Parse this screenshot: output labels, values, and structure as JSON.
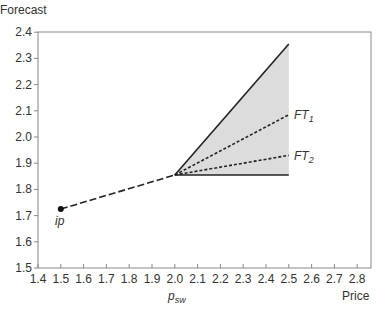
{
  "chart_data": {
    "type": "line",
    "title": "",
    "xlabel": "Price",
    "ylabel": "Forecast",
    "xlim": [
      1.4,
      2.85
    ],
    "ylim": [
      1.5,
      2.4
    ],
    "x_ticks": [
      "1.4",
      "1.5",
      "1.6",
      "1.7",
      "1.8",
      "1.9",
      "2.0",
      "2.1",
      "2.2",
      "2.3",
      "2.4",
      "2.5",
      "2.6",
      "2.7",
      "2.8"
    ],
    "y_ticks": [
      "1.5",
      "1.6",
      "1.7",
      "1.8",
      "1.9",
      "2.0",
      "2.1",
      "2.2",
      "2.3",
      "2.4"
    ],
    "grid": false,
    "legend": "none",
    "x_annotation": {
      "text": "p",
      "subscript": "sw",
      "x": 2.0
    },
    "shaded_region": {
      "polygon": [
        [
          2.0,
          1.855
        ],
        [
          2.5,
          2.355
        ],
        [
          2.5,
          1.855
        ]
      ],
      "color": "#dcdcdc"
    },
    "series": [
      {
        "name": "path from ip",
        "style": "long-dash",
        "x": [
          1.5,
          2.0
        ],
        "y": [
          1.725,
          1.855
        ]
      },
      {
        "name": "upper bound",
        "style": "solid",
        "x": [
          2.0,
          2.5
        ],
        "y": [
          1.855,
          2.355
        ]
      },
      {
        "name": "lower bound",
        "style": "solid",
        "x": [
          2.0,
          2.5
        ],
        "y": [
          1.855,
          1.855
        ]
      },
      {
        "name": "FT1",
        "style": "dotted",
        "x": [
          2.0,
          2.5
        ],
        "y": [
          1.855,
          2.085
        ]
      },
      {
        "name": "FT2",
        "style": "dotted",
        "x": [
          2.0,
          2.5
        ],
        "y": [
          1.855,
          1.93
        ]
      }
    ],
    "annotations": [
      {
        "text": "ip",
        "x": 1.5,
        "y": 1.725,
        "marker": "dot"
      },
      {
        "text": "FT",
        "subscript": "1",
        "x": 2.5,
        "y": 2.085
      },
      {
        "text": "FT",
        "subscript": "2",
        "x": 2.5,
        "y": 1.93
      }
    ]
  },
  "labels": {
    "ylabel": "Forecast",
    "xlabel": "Price",
    "psw_main": "p",
    "psw_sub": "sw",
    "ip": "ip",
    "ft1_main": "FT",
    "ft1_sub": "1",
    "ft2_main": "FT",
    "ft2_sub": "2"
  }
}
